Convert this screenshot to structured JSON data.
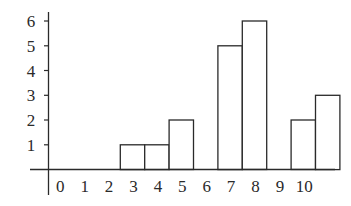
{
  "chart_data": {
    "type": "bar",
    "title": "",
    "xlabel": "",
    "ylabel": "",
    "categories": [
      "0",
      "1",
      "2",
      "3",
      "4",
      "5",
      "6",
      "7",
      "8",
      "9",
      "10"
    ],
    "values": [
      0,
      0,
      1,
      1,
      2,
      0,
      5,
      6,
      0,
      2,
      3
    ],
    "x_tick_labels": [
      "0",
      "1",
      "2",
      "3",
      "4",
      "5",
      "6",
      "7",
      "8",
      "9",
      "10"
    ],
    "y_tick_labels": [
      "1",
      "2",
      "3",
      "4",
      "5",
      "6"
    ],
    "ylim": [
      0,
      6
    ],
    "grid": false,
    "legend": null,
    "style": {
      "bar_fill": "#ffffff",
      "bar_stroke": "#2a2a2a",
      "axis_color": "#2a2a2a"
    }
  }
}
